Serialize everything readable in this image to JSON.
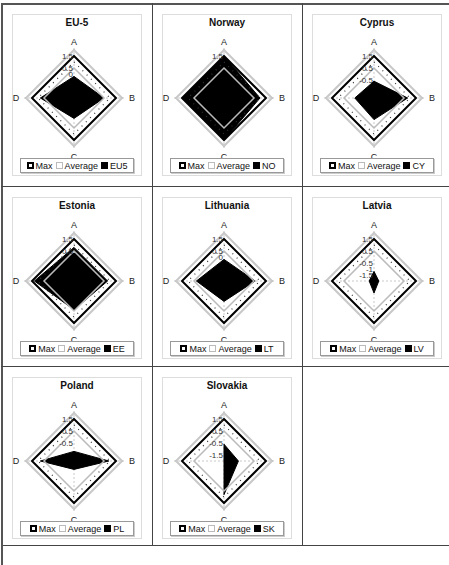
{
  "axis": {
    "labels": [
      "A",
      "B",
      "C",
      "D"
    ],
    "min": -2,
    "max": 2,
    "ticks": [
      1.5,
      0.5,
      -0.5,
      -1.5
    ]
  },
  "legend_common": {
    "max": "Max",
    "average": "Average"
  },
  "colors": {
    "series": "#000000",
    "max": "#000000",
    "average": "#bbbbbb",
    "outer": "#c8c8c8",
    "grid": "#444444"
  },
  "caption": "Note: ... (text cut off at bottom of image)",
  "chart_data": [
    {
      "type": "radar",
      "title": "EU-5",
      "legend_series": "EU5",
      "categories": [
        "A",
        "B",
        "C",
        "D"
      ],
      "series": [
        {
          "name": "Max",
          "values": [
            1.5,
            1.5,
            1.5,
            1.5
          ]
        },
        {
          "name": "Average",
          "values": [
            0.5,
            0.5,
            0.5,
            0.5
          ]
        },
        {
          "name": "EU5",
          "values": [
            -0.2,
            0.5,
            -0.3,
            0.8
          ]
        }
      ],
      "ticks_shown": [
        "1.5",
        "0.5",
        "0"
      ],
      "ylim": [
        -2,
        2
      ]
    },
    {
      "type": "radar",
      "title": "Norway",
      "legend_series": "NO",
      "categories": [
        "A",
        "B",
        "C",
        "D"
      ],
      "series": [
        {
          "name": "Max",
          "values": [
            1.5,
            1.5,
            1.5,
            1.5
          ]
        },
        {
          "name": "Average",
          "values": [
            0.5,
            0.5,
            0.5,
            0.5
          ]
        },
        {
          "name": "NO",
          "values": [
            1.5,
            1.0,
            1.5,
            1.5
          ]
        }
      ],
      "ticks_shown": [
        "1.5"
      ],
      "ylim": [
        -2,
        2
      ]
    },
    {
      "type": "radar",
      "title": "Cyprus",
      "legend_series": "CY",
      "categories": [
        "A",
        "B",
        "C",
        "D"
      ],
      "series": [
        {
          "name": "Max",
          "values": [
            1.5,
            1.5,
            1.5,
            1.5
          ]
        },
        {
          "name": "Average",
          "values": [
            0.5,
            0.5,
            0.5,
            0.5
          ]
        },
        {
          "name": "CY",
          "values": [
            -0.6,
            0.8,
            -0.2,
            -0.4
          ]
        }
      ],
      "ticks_shown": [
        "1.5",
        "0.5",
        "-0.5"
      ],
      "ylim": [
        -2,
        2
      ]
    },
    {
      "type": "radar",
      "title": "Estonia",
      "legend_series": "EE",
      "categories": [
        "A",
        "B",
        "C",
        "D"
      ],
      "series": [
        {
          "name": "Max",
          "values": [
            1.5,
            1.5,
            1.5,
            1.5
          ]
        },
        {
          "name": "Average",
          "values": [
            0.5,
            0.5,
            0.5,
            0.5
          ]
        },
        {
          "name": "EE",
          "values": [
            0.8,
            0.8,
            0.4,
            1.3
          ]
        }
      ],
      "ticks_shown": [
        "1.5",
        "0.5"
      ],
      "ylim": [
        -2,
        2
      ]
    },
    {
      "type": "radar",
      "title": "Lithuania",
      "legend_series": "LT",
      "categories": [
        "A",
        "B",
        "C",
        "D"
      ],
      "series": [
        {
          "name": "Max",
          "values": [
            1.5,
            1.5,
            1.5,
            1.5
          ]
        },
        {
          "name": "Average",
          "values": [
            0.5,
            0.5,
            0.5,
            0.5
          ]
        },
        {
          "name": "LT",
          "values": [
            -0.2,
            0.6,
            -0.3,
            0.3
          ]
        }
      ],
      "ticks_shown": [
        "1.5",
        "0.5",
        "0"
      ],
      "ylim": [
        -2,
        2
      ]
    },
    {
      "type": "radar",
      "title": "Latvia",
      "legend_series": "LV",
      "categories": [
        "A",
        "B",
        "C",
        "D"
      ],
      "series": [
        {
          "name": "Max",
          "values": [
            1.5,
            1.5,
            1.5,
            1.5
          ]
        },
        {
          "name": "Average",
          "values": [
            0.5,
            0.5,
            0.5,
            0.5
          ]
        },
        {
          "name": "LV",
          "values": [
            -1.2,
            -1.6,
            -1.0,
            -1.6
          ]
        }
      ],
      "ticks_shown": [
        "1.5",
        "0.5",
        "-0.5",
        "-1.5",
        "-1"
      ],
      "ylim": [
        -2,
        2
      ]
    },
    {
      "type": "radar",
      "title": "Poland",
      "legend_series": "PL",
      "categories": [
        "A",
        "B",
        "C",
        "D"
      ],
      "series": [
        {
          "name": "Max",
          "values": [
            1.5,
            1.5,
            1.5,
            1.5
          ]
        },
        {
          "name": "Average",
          "values": [
            0.5,
            0.5,
            0.5,
            0.5
          ]
        },
        {
          "name": "PL",
          "values": [
            -1.2,
            0.9,
            -1.3,
            0.8
          ]
        }
      ],
      "ticks_shown": [
        "1.5",
        "0.5",
        "-0.5"
      ],
      "ylim": [
        -2,
        2
      ]
    },
    {
      "type": "radar",
      "title": "Slovakia",
      "legend_series": "SK",
      "categories": [
        "A",
        "B",
        "C",
        "D"
      ],
      "series": [
        {
          "name": "Max",
          "values": [
            1.5,
            1.5,
            1.5,
            1.5
          ]
        },
        {
          "name": "Average",
          "values": [
            0.5,
            0.5,
            0.5,
            0.5
          ]
        },
        {
          "name": "SK",
          "values": [
            -0.6,
            -0.8,
            0.8,
            -2.0
          ]
        }
      ],
      "ticks_shown": [
        "1.5",
        "0.5",
        "-0.5",
        "-1.5"
      ],
      "ylim": [
        -2,
        2
      ]
    }
  ]
}
